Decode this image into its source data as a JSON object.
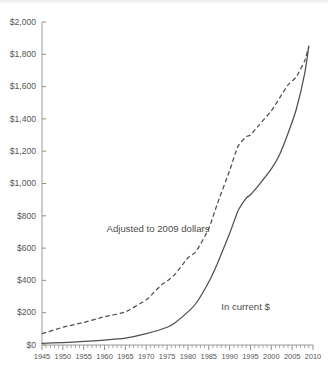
{
  "chart_data": {
    "type": "line",
    "title": "",
    "subtitle": "",
    "xlabel": "",
    "ylabel": "",
    "xlim": [
      1945,
      2010
    ],
    "ylim": [
      0,
      2000
    ],
    "grid": false,
    "legend_position": "inline-annotations",
    "x_tick_labels": [
      "1945",
      "1950",
      "1955",
      "1960",
      "1965",
      "1970",
      "1975",
      "1980",
      "1985",
      "1990",
      "1995",
      "2000",
      "2005",
      "2010"
    ],
    "x_tick_values": [
      1945,
      1950,
      1955,
      1960,
      1965,
      1970,
      1975,
      1980,
      1985,
      1990,
      1995,
      2000,
      2005,
      2010
    ],
    "x_minor_tick_step": 1,
    "y_tick_labels": [
      "$0",
      "$200",
      "$400",
      "$600",
      "$800",
      "$1,000",
      "$1,200",
      "$1,400",
      "$1,600",
      "$1,800",
      "$2,000"
    ],
    "y_tick_values": [
      0,
      200,
      400,
      600,
      800,
      1000,
      1200,
      1400,
      1600,
      1800,
      2000
    ],
    "annotations": [
      {
        "name": "adjusted-series-label",
        "text": "Adjusted to 2009 dollars",
        "x": 1960.5,
        "y": 700
      },
      {
        "name": "current-series-label",
        "text": "In current $",
        "x": 1988.0,
        "y": 215
      }
    ],
    "series": [
      {
        "name": "Adjusted to 2009 dollars",
        "style": "dashed",
        "x": [
          1945,
          1950,
          1955,
          1960,
          1965,
          1970,
          1972,
          1974,
          1975,
          1977,
          1980,
          1982,
          1985,
          1987,
          1990,
          1992,
          1994,
          1995,
          1997,
          2000,
          2002,
          2004,
          2006,
          2008,
          2009
        ],
        "values": [
          70,
          110,
          140,
          175,
          205,
          280,
          330,
          380,
          395,
          440,
          540,
          580,
          720,
          870,
          1080,
          1230,
          1290,
          1300,
          1360,
          1450,
          1530,
          1610,
          1660,
          1760,
          1850
        ]
      },
      {
        "name": "In current $",
        "style": "solid",
        "x": [
          1945,
          1950,
          1955,
          1960,
          1965,
          1970,
          1975,
          1977,
          1980,
          1982,
          1985,
          1987,
          1990,
          1992,
          1994,
          1995,
          1997,
          2000,
          2002,
          2004,
          2006,
          2008,
          2009
        ],
        "values": [
          10,
          15,
          22,
          30,
          42,
          70,
          110,
          140,
          205,
          260,
          390,
          500,
          690,
          830,
          910,
          930,
          990,
          1090,
          1180,
          1310,
          1460,
          1680,
          1850
        ]
      }
    ],
    "colors": {
      "series_line": "#4f4f4f",
      "axis": "#9a9a9a",
      "tick_label": "#555555",
      "annotation": "#4d4d4d",
      "background": "#ffffff"
    }
  }
}
